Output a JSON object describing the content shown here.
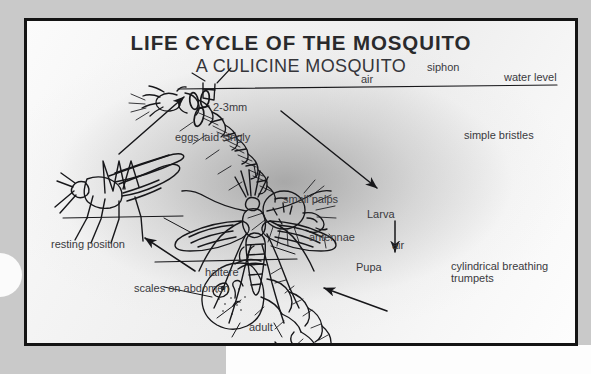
{
  "poster": {
    "title": "LIFE CYCLE OF THE MOSQUITO",
    "subtitle": "A CULICINE MOSQUITO",
    "frame_color": "#141414",
    "background_color": "#f2f2f2",
    "text_color": "#3a3a3e"
  },
  "page": {
    "left_band_color": "#c9c9c9",
    "right_band_color": "#fdfdfd"
  },
  "labels": {
    "siphon": "siphon",
    "air_top": "air",
    "water_level": "water level",
    "simple_bristles": "simple bristles",
    "egg_size": "2-3mm",
    "eggs_laid_singly": "eggs laid singly",
    "resting_position": "resting position",
    "larva": "Larva",
    "air_pupa": "air",
    "pupa": "Pupa",
    "cylindrical_breathing_trumpets": "cylindrical breathing trumpets",
    "small_palps": "small palps",
    "antennae": "antennae",
    "haltere": "haltere",
    "scales_on_abdomen": "scales on abdomen",
    "adult": "adult"
  },
  "stages": [
    {
      "name": "eggs",
      "label": "eggs laid singly",
      "detail": "2-3mm"
    },
    {
      "name": "larva",
      "label": "Larva",
      "detail": "simple bristles"
    },
    {
      "name": "pupa",
      "label": "Pupa",
      "detail": "cylindrical breathing trumpets"
    },
    {
      "name": "adult",
      "label": "adult",
      "detail": "resting position"
    }
  ]
}
